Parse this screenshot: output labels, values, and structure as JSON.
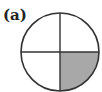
{
  "figure": {
    "label": "(a)",
    "shape": "circle divided into 4 equal quadrants",
    "quadrants_total": 4,
    "shaded_quadrants": [
      "bottom-right"
    ],
    "shaded_fraction": "1/4",
    "colors": {
      "stroke": "#333333",
      "shade": "#a8a8a8",
      "background": "#ffffff"
    }
  }
}
